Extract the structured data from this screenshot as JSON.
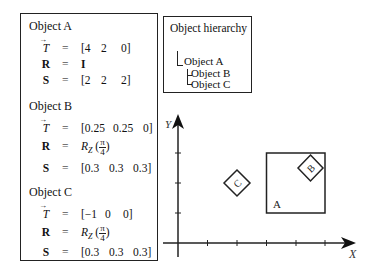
{
  "objects": [
    {
      "title": "Object A",
      "T_label": "T",
      "R_label": "R",
      "S_label": "S",
      "eq": "=",
      "T": [
        "[4",
        "2",
        "0]"
      ],
      "R": "I",
      "S": [
        "[2",
        "2",
        "2]"
      ]
    },
    {
      "title": "Object B",
      "T_label": "T",
      "R_label": "R",
      "S_label": "S",
      "eq": "=",
      "T": [
        "[0.25",
        "0.25",
        "0]"
      ],
      "R_func": "R",
      "R_sub": "Z",
      "R_num": "π",
      "R_den": "4",
      "S": [
        "[0.3",
        "0.3",
        "0.3]"
      ]
    },
    {
      "title": "Object C",
      "T_label": "T",
      "R_label": "R",
      "S_label": "S",
      "eq": "=",
      "T": [
        "[−1",
        "0",
        "0]"
      ],
      "R_func": "R",
      "R_sub": "Z",
      "R_num": "π",
      "R_den": "4",
      "S": [
        "[0.3",
        "0.3",
        "0.3]"
      ]
    }
  ],
  "hierarchy": {
    "title": "Object hierarchy",
    "root": "Object A",
    "children": [
      "Object B",
      "Object C"
    ]
  },
  "plot": {
    "x_axis_label": "X",
    "y_axis_label": "Y",
    "x_ticks": [
      1,
      2,
      3,
      4,
      5
    ],
    "y_ticks": [
      1,
      2,
      3
    ],
    "shapes": [
      {
        "name": "A",
        "type": "square",
        "x": [
          3,
          5
        ],
        "y": [
          1,
          3
        ],
        "label_pos": [
          3.25,
          1.2
        ]
      },
      {
        "name": "B",
        "type": "diamond",
        "center": [
          4.5,
          2.5
        ],
        "half_diag": 0.45
      },
      {
        "name": "C",
        "type": "diamond",
        "center": [
          2,
          2
        ],
        "half_diag": 0.45
      }
    ]
  }
}
